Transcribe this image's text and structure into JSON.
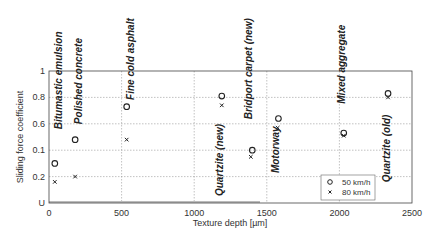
{
  "chart_data": {
    "type": "scatter",
    "title": "",
    "xlabel": "Texture depth [µm]",
    "ylabel": "Sliding force coefficient",
    "xlim": [
      0,
      2500
    ],
    "ylim": [
      0,
      1
    ],
    "x_ticks": [
      0,
      500,
      1000,
      1500,
      2000,
      2500
    ],
    "x_tick_labels": [
      "0",
      "500",
      "1000",
      "1500",
      "2000",
      "2500"
    ],
    "y_ticks": [
      0,
      0.2,
      0.4,
      0.6,
      0.8,
      1
    ],
    "y_tick_labels": [
      "U",
      "0.2",
      "0.1",
      "0.6",
      "0.8",
      "1"
    ],
    "grid": true,
    "legend_position": "lower right",
    "series": [
      {
        "name": "50 km/h",
        "marker": "o",
        "x": [
          40,
          180,
          535,
          1190,
          1400,
          1580,
          2030,
          2335
        ],
        "values": [
          0.3,
          0.48,
          0.73,
          0.81,
          0.4,
          0.64,
          0.53,
          0.83
        ]
      },
      {
        "name": "80 km/h",
        "marker": "x",
        "x": [
          40,
          180,
          535,
          1190,
          1390,
          1575,
          2030,
          2335
        ],
        "values": [
          0.16,
          0.2,
          0.48,
          0.74,
          0.35,
          0.57,
          0.51,
          0.8
        ]
      }
    ],
    "annotations": [
      {
        "text": "Bitumastic emulsion",
        "x": 60,
        "y_top": 1.3
      },
      {
        "text": "Polished concrete",
        "x": 200,
        "y_top": 1.25
      },
      {
        "text": "Fine cold asphalt",
        "x": 555,
        "y_top": 1.4
      },
      {
        "text": "Quartzite (new)",
        "x": 1170,
        "y_top": 0.6
      },
      {
        "text": "Bridport carpet (new)",
        "x": 1370,
        "y_top": 1.4
      },
      {
        "text": "Motorway",
        "x": 1555,
        "y_top": 0.58
      },
      {
        "text": "Mixed aggregate",
        "x": 2010,
        "y_top": 1.35
      },
      {
        "text": "Quartzite (old)",
        "x": 2320,
        "y_top": 0.67
      }
    ]
  }
}
